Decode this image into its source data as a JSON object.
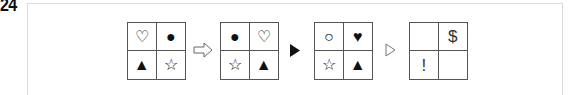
{
  "question_number": "24",
  "colors": {
    "frame": "#dcdcdc",
    "grid_border": "#555555",
    "symbol": "#111111"
  },
  "sequence": [
    {
      "type": "grid",
      "cells": [
        "♡",
        "●",
        "▲",
        "☆"
      ]
    },
    {
      "type": "connector",
      "icon": "outline-block-arrow-right"
    },
    {
      "type": "grid",
      "cells": [
        "●",
        "♡",
        "☆",
        "▲"
      ]
    },
    {
      "type": "connector",
      "icon": "solid-triangle-right"
    },
    {
      "type": "grid",
      "cells": [
        "○",
        "♥",
        "☆",
        "▲"
      ]
    },
    {
      "type": "connector",
      "icon": "outline-triangle-right"
    },
    {
      "type": "grid",
      "cells": [
        "",
        "$",
        "!",
        ""
      ]
    }
  ],
  "grids": [
    {
      "cells": [
        "♡",
        "●",
        "▲",
        "☆"
      ]
    },
    {
      "cells": [
        "●",
        "♡",
        "☆",
        "▲"
      ]
    },
    {
      "cells": [
        "○",
        "♥",
        "☆",
        "▲"
      ]
    },
    {
      "cells": [
        "",
        "$",
        "!",
        ""
      ]
    }
  ]
}
